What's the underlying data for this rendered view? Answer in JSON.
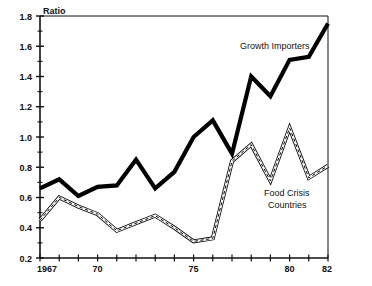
{
  "chart_data": {
    "type": "line",
    "title": "",
    "subtitle": "",
    "xlabel": "",
    "ylabel": "Ratio",
    "ylim": [
      0.2,
      1.8
    ],
    "xlim": [
      1967,
      1982
    ],
    "y_ticks": [
      0.2,
      0.4,
      0.6,
      0.8,
      1.0,
      1.2,
      1.4,
      1.6,
      1.8
    ],
    "y_tick_labels": [
      "0.2",
      "0.4",
      "0.6",
      "0.8",
      "1.0",
      "1.2",
      "1.4",
      "1.6",
      "1.8"
    ],
    "y_minor_ticks": [
      0.3,
      0.5,
      0.7,
      0.9,
      1.1,
      1.3,
      1.5,
      1.7
    ],
    "x_ticks": [
      1967,
      1968,
      1969,
      1970,
      1971,
      1972,
      1973,
      1974,
      1975,
      1976,
      1977,
      1978,
      1979,
      1980,
      1981,
      1982
    ],
    "x_tick_labels": [
      {
        "x": 1967,
        "label": "1967"
      },
      {
        "x": 1970,
        "label": "70"
      },
      {
        "x": 1975,
        "label": "75"
      },
      {
        "x": 1980,
        "label": "80"
      },
      {
        "x": 1982,
        "label": "82"
      }
    ],
    "grid": false,
    "legend_position": "inline-annotations",
    "x": [
      1967,
      1968,
      1969,
      1970,
      1971,
      1972,
      1973,
      1974,
      1975,
      1976,
      1977,
      1978,
      1979,
      1980,
      1981,
      1982
    ],
    "series": [
      {
        "name": "Growth Importers",
        "style": "thick-solid",
        "color": "#000000",
        "values": [
          0.66,
          0.72,
          0.61,
          0.67,
          0.68,
          0.85,
          0.66,
          0.77,
          1.0,
          1.11,
          0.89,
          1.4,
          1.27,
          1.51,
          1.53,
          1.75
        ]
      },
      {
        "name": "Food Crisis Countries",
        "style": "thin-outlined",
        "color": "#000000",
        "values": [
          0.45,
          0.6,
          0.54,
          0.49,
          0.38,
          0.43,
          0.48,
          0.4,
          0.31,
          0.33,
          0.84,
          0.95,
          0.71,
          1.06,
          0.73,
          0.81
        ]
      }
    ],
    "annotations": [
      {
        "name": "growth-importers-label",
        "text": "Growth Importers",
        "x_px": 240,
        "y_px": 49
      },
      {
        "name": "food-crisis-label-line1",
        "text": "Food Crisis",
        "x_px": 264,
        "y_px": 196
      },
      {
        "name": "food-crisis-label-line2",
        "text": "Countries",
        "x_px": 268,
        "y_px": 208
      }
    ]
  },
  "axes": {
    "y_axis_title": "Ratio"
  }
}
